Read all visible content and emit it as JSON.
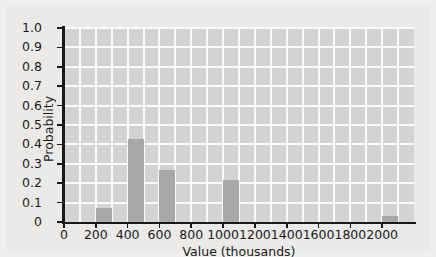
{
  "chart_data": {
    "type": "bar",
    "title": "",
    "xlabel": "Value (thousands)",
    "ylabel": "Probability",
    "xlim": [
      0,
      2200
    ],
    "ylim": [
      0,
      1.0
    ],
    "grid": true,
    "legend": null,
    "bar_width": 100,
    "bar_align": "left",
    "x": [
      200,
      400,
      600,
      1000,
      2000
    ],
    "values": [
      0.07,
      0.43,
      0.27,
      0.215,
      0.03
    ],
    "bars": [
      {
        "x": 200,
        "value": 0.07
      },
      {
        "x": 400,
        "value": 0.43
      },
      {
        "x": 600,
        "value": 0.27
      },
      {
        "x": 1000,
        "value": 0.215
      },
      {
        "x": 2000,
        "value": 0.03
      }
    ],
    "xticks": [
      {
        "value": 0,
        "label": "0"
      },
      {
        "value": 200,
        "label": "200"
      },
      {
        "value": 400,
        "label": "400"
      },
      {
        "value": 600,
        "label": "600"
      },
      {
        "value": 800,
        "label": "800"
      },
      {
        "value": 1000,
        "label": "1000"
      },
      {
        "value": 1200,
        "label": "1200"
      },
      {
        "value": 1400,
        "label": "1400"
      },
      {
        "value": 1600,
        "label": "1600"
      },
      {
        "value": 1800,
        "label": "1800"
      },
      {
        "value": 2000,
        "label": "2000"
      }
    ],
    "yticks": [
      {
        "value": 0,
        "label": "0"
      },
      {
        "value": 0.1,
        "label": "0.1"
      },
      {
        "value": 0.2,
        "label": "0.2"
      },
      {
        "value": 0.3,
        "label": "0.3"
      },
      {
        "value": 0.4,
        "label": "0.4"
      },
      {
        "value": 0.5,
        "label": "0.5"
      },
      {
        "value": 0.6,
        "label": "0.6"
      },
      {
        "value": 0.7,
        "label": "0.7"
      },
      {
        "value": 0.8,
        "label": "0.8"
      },
      {
        "value": 0.9,
        "label": "0.9"
      },
      {
        "value": 1.0,
        "label": "1.0"
      }
    ],
    "xgrid_step": 100,
    "colors": {
      "bar": "#a9a8a7",
      "plot_background": "#d4d3d1",
      "figure_background": "#eceae8",
      "grid": "#fbfbfb",
      "axis": "#19191a",
      "text": "#19191a"
    }
  }
}
